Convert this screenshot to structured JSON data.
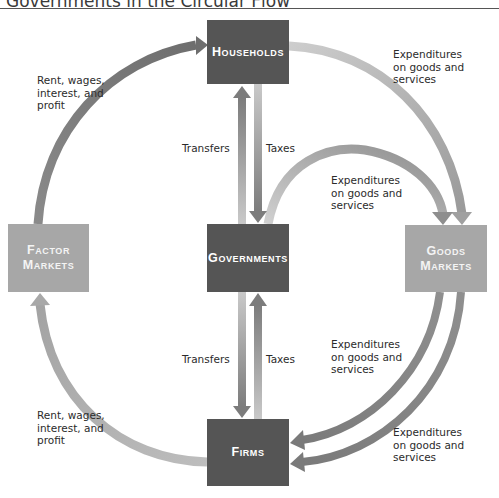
{
  "figure": {
    "title": "Governments in the Circular Flow"
  },
  "nodes": {
    "households": "Households",
    "governments": "Governments",
    "factor_markets": "Factor\nMarkets",
    "goods_markets": "Goods\nMarkets",
    "firms": "Firms"
  },
  "labels": {
    "hh_expenditures": "Expenditures\non goods and\nservices",
    "gov_expenditures_goods": "Expenditures\non goods and\nservices",
    "goods_to_firms_1": "Expenditures\non goods and\nservices",
    "goods_to_firms_2": "Expenditures\non goods and\nservices",
    "factor_income_top": "Rent, wages,\ninterest, and\nprofit",
    "factor_income_bottom": "Rent, wages,\ninterest, and\nprofit",
    "transfers_top": "Transfers",
    "taxes_top": "Taxes",
    "transfers_bottom": "Transfers",
    "taxes_bottom": "Taxes"
  },
  "colors": {
    "dark_box": "#555555",
    "light_box": "#a7a7a7",
    "dark_arrow": "#7a7a7a",
    "light_arrow": "#c4c4c4"
  }
}
